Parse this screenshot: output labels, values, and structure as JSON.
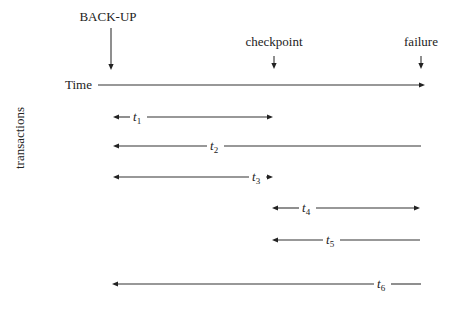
{
  "diagram": {
    "top_caption_fragment": "",
    "markers": [
      {
        "id": "backup",
        "label": "BACK-UP",
        "x": 111,
        "label_x": 108,
        "label_y": 21,
        "arrow_y1": 28,
        "arrow_y2": 70
      },
      {
        "id": "checkpoint",
        "label": "checkpoint",
        "x": 274,
        "label_x": 274,
        "label_y": 46,
        "arrow_y1": 56,
        "arrow_y2": 69
      },
      {
        "id": "failure",
        "label": "failure",
        "x": 421,
        "label_x": 421,
        "label_y": 46,
        "arrow_y1": 56,
        "arrow_y2": 69
      }
    ],
    "time_axis": {
      "label": "Time",
      "label_x": 65,
      "y": 85,
      "x1": 98,
      "x2": 425
    },
    "y_axis_label": "transactions",
    "transactions": [
      {
        "name": "t",
        "sub": "1",
        "y": 117,
        "x1": 113,
        "x2": 273,
        "left_arrow": true,
        "right_arrow": true,
        "label_x": 133
      },
      {
        "name": "t",
        "sub": "2",
        "y": 146,
        "x1": 113,
        "x2": 421,
        "left_arrow": true,
        "right_arrow": false,
        "label_x": 210
      },
      {
        "name": "t",
        "sub": "3",
        "y": 177,
        "x1": 113,
        "x2": 273,
        "left_arrow": true,
        "right_arrow": true,
        "label_x": 252
      },
      {
        "name": "t",
        "sub": "4",
        "y": 208,
        "x1": 272,
        "x2": 420,
        "left_arrow": true,
        "right_arrow": true,
        "label_x": 302
      },
      {
        "name": "t",
        "sub": "5",
        "y": 240,
        "x1": 272,
        "x2": 420,
        "left_arrow": true,
        "right_arrow": false,
        "label_x": 326
      },
      {
        "name": "t",
        "sub": "6",
        "y": 284,
        "x1": 112,
        "x2": 421,
        "left_arrow": true,
        "right_arrow": false,
        "label_x": 377
      }
    ]
  }
}
